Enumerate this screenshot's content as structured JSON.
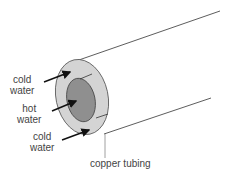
{
  "diagram": {
    "labels": {
      "cold_top_line1": "cold",
      "cold_top_line2": "water",
      "hot_line1": "hot",
      "hot_line2": "water",
      "cold_bottom_line1": "cold",
      "cold_bottom_line2": "water",
      "tubing": "copper tubing"
    },
    "colors": {
      "outer_ring": "#d4d4d4",
      "inner_core": "#8f8f8f",
      "lines": "#333333",
      "text": "#444444"
    }
  }
}
